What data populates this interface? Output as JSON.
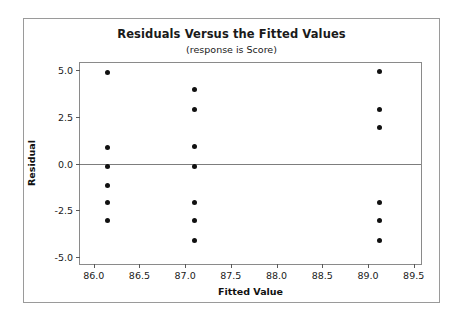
{
  "chart_data": {
    "type": "scatter",
    "title": "Residuals Versus the Fitted Values",
    "subtitle": "(response is Score)",
    "xlabel": "Fitted Value",
    "ylabel": "Residual",
    "xlim": [
      85.85,
      89.58
    ],
    "ylim": [
      -5.35,
      5.35
    ],
    "grid": false,
    "legend": null,
    "xticks": [
      86.0,
      86.5,
      87.0,
      87.5,
      88.0,
      88.5,
      89.0,
      89.5
    ],
    "xtick_labels": [
      "86.0",
      "86.5",
      "87.0",
      "87.5",
      "88.0",
      "88.5",
      "89.0",
      "89.5"
    ],
    "yticks": [
      5.0,
      2.5,
      0.0,
      -2.5,
      -5.0
    ],
    "ytick_labels": [
      "5.0",
      "2.5",
      "0.0",
      "-2.5",
      "-5.0"
    ],
    "reference_line": {
      "orientation": "horizontal",
      "value": 0.0,
      "color": "#7d7d7d"
    },
    "marker": {
      "shape": "circle",
      "color": "#111111",
      "size": 5
    },
    "points": [
      {
        "x": 86.15,
        "y": 4.85
      },
      {
        "x": 86.15,
        "y": 0.85
      },
      {
        "x": 86.15,
        "y": -0.15
      },
      {
        "x": 86.15,
        "y": -1.15
      },
      {
        "x": 86.15,
        "y": -2.1
      },
      {
        "x": 86.15,
        "y": -3.05
      },
      {
        "x": 87.1,
        "y": 3.95
      },
      {
        "x": 87.1,
        "y": 2.85
      },
      {
        "x": 87.1,
        "y": 0.9
      },
      {
        "x": 87.1,
        "y": -0.15
      },
      {
        "x": 87.1,
        "y": -2.1
      },
      {
        "x": 87.1,
        "y": -3.05
      },
      {
        "x": 87.1,
        "y": -4.1
      },
      {
        "x": 89.13,
        "y": 4.9
      },
      {
        "x": 89.13,
        "y": 2.85
      },
      {
        "x": 89.13,
        "y": 1.9
      },
      {
        "x": 89.13,
        "y": -2.1
      },
      {
        "x": 89.13,
        "y": -3.05
      },
      {
        "x": 89.13,
        "y": -4.1
      }
    ]
  }
}
